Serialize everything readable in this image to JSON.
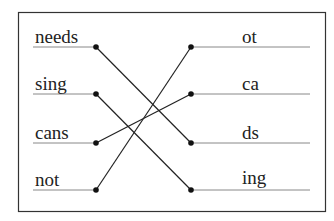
{
  "diagram": {
    "type": "matching-exercise",
    "left_items": [
      {
        "label": "needs",
        "y": 47
      },
      {
        "label": "sing",
        "y": 94
      },
      {
        "label": "cans",
        "y": 143
      },
      {
        "label": "not",
        "y": 190
      }
    ],
    "right_items": [
      {
        "label": "ot",
        "y": 47
      },
      {
        "label": "ca",
        "y": 94
      },
      {
        "label": "ds",
        "y": 143
      },
      {
        "label": "ing",
        "y": 190
      }
    ],
    "connections": [
      {
        "from": "needs",
        "to": "ds"
      },
      {
        "from": "sing",
        "to": "ing"
      },
      {
        "from": "cans",
        "to": "ca"
      },
      {
        "from": "not",
        "to": "ot"
      }
    ],
    "colors": {
      "line": "#222222",
      "underline": "#888888",
      "border": "#333333"
    }
  }
}
